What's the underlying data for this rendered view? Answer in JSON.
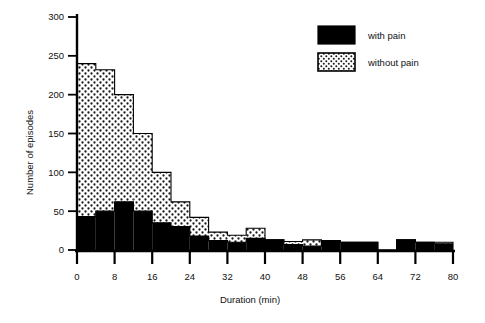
{
  "chart_data": {
    "type": "bar",
    "subtype": "stacked-histogram",
    "title": "",
    "xlabel": "Duration (min)",
    "ylabel": "Number of episodes",
    "xlim": [
      0,
      80
    ],
    "ylim": [
      0,
      300
    ],
    "bin_width": 4,
    "grid": false,
    "legend_position": "top-right",
    "xticks": [
      0,
      8,
      16,
      24,
      32,
      40,
      48,
      56,
      64,
      72,
      80
    ],
    "xtick_labels": [
      "0",
      "8",
      "16",
      "24",
      "32",
      "40",
      "48",
      "56",
      "64",
      "72",
      "80"
    ],
    "yticks": [
      0,
      50,
      100,
      150,
      200,
      250,
      300
    ],
    "ytick_labels": [
      "0",
      "50",
      "100",
      "150",
      "200",
      "250",
      "300"
    ],
    "bin_starts": [
      0,
      4,
      8,
      12,
      16,
      20,
      24,
      28,
      32,
      36,
      40,
      44,
      48,
      52,
      56,
      60,
      64,
      68,
      72,
      76
    ],
    "bin_ends": [
      4,
      8,
      12,
      16,
      20,
      24,
      28,
      32,
      36,
      40,
      44,
      48,
      52,
      56,
      60,
      64,
      68,
      72,
      76,
      80
    ],
    "series": [
      {
        "name": "with pain",
        "fill": "solid-black",
        "color": "#000000",
        "values": [
          43,
          50,
          62,
          50,
          35,
          30,
          18,
          12,
          10,
          15,
          13,
          7,
          5,
          12,
          10,
          10,
          0,
          13,
          10,
          8
        ]
      },
      {
        "name": "without pain",
        "fill": "stipple-dots",
        "color": "#ffffff",
        "values": [
          197,
          182,
          138,
          100,
          65,
          32,
          24,
          11,
          9,
          13,
          0,
          4,
          8,
          0,
          0,
          0,
          0,
          0,
          0,
          2
        ]
      }
    ],
    "totals": [
      240,
      232,
      200,
      150,
      100,
      62,
      42,
      23,
      19,
      28,
      13,
      11,
      13,
      12,
      10,
      10,
      0,
      13,
      10,
      10
    ]
  },
  "legend": {
    "entries": [
      {
        "label": "with pain",
        "swatch": "solid"
      },
      {
        "label": "without pain",
        "swatch": "stipple"
      }
    ]
  },
  "axes": {
    "x_title": "Duration (min)",
    "y_title": "Number of episodes"
  }
}
